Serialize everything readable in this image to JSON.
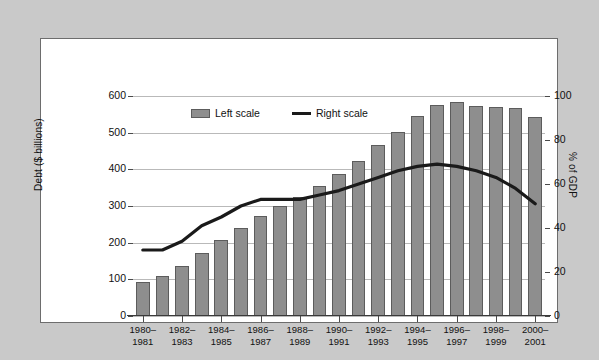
{
  "chart_data": {
    "type": "bar",
    "title": "",
    "xlabel": "",
    "ylabel": "Debt ($ billions)",
    "y2label": "% of GDP",
    "ylim": [
      0,
      600
    ],
    "y2lim": [
      0,
      100
    ],
    "grid": true,
    "legend_position": "top-left-inside",
    "y_ticks": [
      "0",
      "100",
      "200",
      "300",
      "400",
      "500",
      "600"
    ],
    "y2_ticks": [
      "0",
      "20",
      "40",
      "60",
      "80",
      "100"
    ],
    "categories": [
      "1980–1981",
      "1981–1982",
      "1982–1983",
      "1983–1984",
      "1984–1985",
      "1985–1986",
      "1986–1987",
      "1987–1988",
      "1988–1989",
      "1989–1990",
      "1990–1991",
      "1991–1992",
      "1992–1993",
      "1993–1994",
      "1994–1995",
      "1995–1996",
      "1996–1997",
      "1997–1998",
      "1998–1999",
      "1999–2000",
      "2000–2001"
    ],
    "x_tick_labels": [
      {
        "index": 0,
        "line1": "1980–",
        "line2": "1981"
      },
      {
        "index": 2,
        "line1": "1982–",
        "line2": "1983"
      },
      {
        "index": 4,
        "line1": "1984–",
        "line2": "1985"
      },
      {
        "index": 6,
        "line1": "1986–",
        "line2": "1987"
      },
      {
        "index": 8,
        "line1": "1988–",
        "line2": "1989"
      },
      {
        "index": 10,
        "line1": "1990–",
        "line2": "1991"
      },
      {
        "index": 12,
        "line1": "1992–",
        "line2": "1993"
      },
      {
        "index": 14,
        "line1": "1994–",
        "line2": "1995"
      },
      {
        "index": 16,
        "line1": "1996–",
        "line2": "1997"
      },
      {
        "index": 18,
        "line1": "1998–",
        "line2": "1999"
      },
      {
        "index": 20,
        "line1": "2000–",
        "line2": "2001"
      }
    ],
    "series": [
      {
        "name": "Left scale",
        "type": "bar",
        "axis": "left",
        "unit": "$ billions",
        "color": "#8e8e8e",
        "values": [
          94,
          110,
          137,
          173,
          206,
          241,
          272,
          299,
          324,
          355,
          388,
          423,
          466,
          503,
          545,
          575,
          583,
          574,
          569,
          566,
          543
        ]
      },
      {
        "name": "Right scale",
        "type": "line",
        "axis": "right",
        "unit": "% of GDP",
        "color": "#1a1a1a",
        "values": [
          30,
          30,
          34,
          41,
          45,
          50,
          53,
          53,
          53,
          55,
          57,
          60,
          63,
          66,
          68,
          69,
          68,
          66,
          63,
          58,
          51
        ]
      }
    ]
  },
  "legend": {
    "items": [
      {
        "label": "Left scale",
        "marker": "bar-swatch"
      },
      {
        "label": "Right scale",
        "marker": "line-swatch"
      }
    ]
  }
}
